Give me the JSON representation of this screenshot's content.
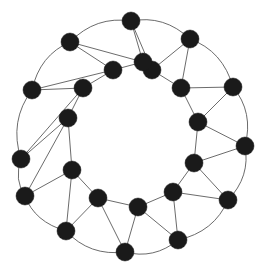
{
  "figure": {
    "type": "node-link-diagram",
    "background_color": "#ffffff",
    "node_color": "#1a1a1a",
    "edge_color": "#5a5a5a",
    "node_radius": 9,
    "edge_width": 0.9,
    "node_count": 24,
    "edge_count": 60,
    "width": 266,
    "height": 275
  },
  "graph_data": {
    "type": "graph",
    "layout": "two-concentric-rings",
    "outer_ring": {
      "count": 12,
      "center": [
        133,
        146
      ],
      "radius": 113
    },
    "inner_ring": {
      "count": 12,
      "center": [
        133,
        140
      ],
      "radius": 72
    },
    "nodes": [
      {
        "id": "o0",
        "ring": "outer",
        "index": 0,
        "x": 131,
        "y": 21
      },
      {
        "id": "o1",
        "ring": "outer",
        "index": 1,
        "x": 190,
        "y": 39
      },
      {
        "id": "o2",
        "ring": "outer",
        "index": 2,
        "x": 233,
        "y": 87
      },
      {
        "id": "o3",
        "ring": "outer",
        "index": 3,
        "x": 245,
        "y": 146
      },
      {
        "id": "o4",
        "ring": "outer",
        "index": 4,
        "x": 228,
        "y": 200
      },
      {
        "id": "o5",
        "ring": "outer",
        "index": 5,
        "x": 178,
        "y": 240
      },
      {
        "id": "o6",
        "ring": "outer",
        "index": 6,
        "x": 125,
        "y": 252
      },
      {
        "id": "o7",
        "ring": "outer",
        "index": 7,
        "x": 66,
        "y": 231
      },
      {
        "id": "o8",
        "ring": "outer",
        "index": 8,
        "x": 25,
        "y": 196
      },
      {
        "id": "o9",
        "ring": "outer",
        "index": 9,
        "x": 21,
        "y": 159
      },
      {
        "id": "o10",
        "ring": "outer",
        "index": 10,
        "x": 32,
        "y": 90
      },
      {
        "id": "o11",
        "ring": "outer",
        "index": 11,
        "x": 70,
        "y": 42
      },
      {
        "id": "i0",
        "ring": "inner",
        "index": 0,
        "x": 152,
        "y": 70
      },
      {
        "id": "i1",
        "ring": "inner",
        "index": 1,
        "x": 181,
        "y": 88
      },
      {
        "id": "i2",
        "ring": "inner",
        "index": 2,
        "x": 198,
        "y": 122
      },
      {
        "id": "i3",
        "ring": "inner",
        "index": 3,
        "x": 194,
        "y": 163
      },
      {
        "id": "i4",
        "ring": "inner",
        "index": 4,
        "x": 173,
        "y": 192
      },
      {
        "id": "i5",
        "ring": "inner",
        "index": 5,
        "x": 138,
        "y": 207
      },
      {
        "id": "i6",
        "ring": "inner",
        "index": 6,
        "x": 98,
        "y": 198
      },
      {
        "id": "i7",
        "ring": "inner",
        "index": 7,
        "x": 72,
        "y": 170
      },
      {
        "id": "i8",
        "ring": "inner",
        "index": 8,
        "x": 68,
        "y": 118
      },
      {
        "id": "i9",
        "ring": "inner",
        "index": 9,
        "x": 83,
        "y": 88
      },
      {
        "id": "i10",
        "ring": "inner",
        "index": 10,
        "x": 113,
        "y": 70
      },
      {
        "id": "i11",
        "ring": "inner",
        "index": 11,
        "x": 143,
        "y": 62
      }
    ],
    "outer_edges": [
      [
        "o0",
        "o1"
      ],
      [
        "o1",
        "o2"
      ],
      [
        "o2",
        "o3"
      ],
      [
        "o3",
        "o4"
      ],
      [
        "o4",
        "o5"
      ],
      [
        "o5",
        "o6"
      ],
      [
        "o6",
        "o7"
      ],
      [
        "o7",
        "o8"
      ],
      [
        "o8",
        "o9"
      ],
      [
        "o9",
        "o10"
      ],
      [
        "o10",
        "o11"
      ],
      [
        "o11",
        "o0"
      ]
    ],
    "inner_edges": [
      [
        "i0",
        "i1"
      ],
      [
        "i1",
        "i2"
      ],
      [
        "i2",
        "i3"
      ],
      [
        "i3",
        "i4"
      ],
      [
        "i4",
        "i5"
      ],
      [
        "i5",
        "i6"
      ],
      [
        "i6",
        "i7"
      ],
      [
        "i7",
        "i8"
      ],
      [
        "i8",
        "i9"
      ],
      [
        "i9",
        "i10"
      ],
      [
        "i10",
        "i11"
      ],
      [
        "i11",
        "i0"
      ]
    ],
    "spoke_edges": [
      [
        "o0",
        "i11"
      ],
      [
        "o0",
        "i0"
      ],
      [
        "o1",
        "i0"
      ],
      [
        "o1",
        "i1"
      ],
      [
        "o2",
        "i1"
      ],
      [
        "o2",
        "i2"
      ],
      [
        "o3",
        "i2"
      ],
      [
        "o3",
        "i3"
      ],
      [
        "o4",
        "i3"
      ],
      [
        "o4",
        "i4"
      ],
      [
        "o5",
        "i4"
      ],
      [
        "o5",
        "i5"
      ],
      [
        "o6",
        "i5"
      ],
      [
        "o6",
        "i6"
      ],
      [
        "o7",
        "i6"
      ],
      [
        "o7",
        "i7"
      ],
      [
        "o8",
        "i7"
      ],
      [
        "o8",
        "i8"
      ],
      [
        "o9",
        "i8"
      ],
      [
        "o9",
        "i9"
      ],
      [
        "o10",
        "i9"
      ],
      [
        "o10",
        "i10"
      ],
      [
        "o11",
        "i10"
      ],
      [
        "o11",
        "i11"
      ]
    ],
    "chord_edges": [
      [
        "i11",
        "i10"
      ],
      [
        "i1",
        "i0"
      ],
      [
        "i3",
        "i2"
      ],
      [
        "i5",
        "i4"
      ],
      [
        "i7",
        "i6"
      ],
      [
        "i9",
        "i8"
      ]
    ],
    "outer_arc_edges": [
      [
        "o0",
        "o1"
      ],
      [
        "o1",
        "o2"
      ],
      [
        "o2",
        "o3"
      ],
      [
        "o3",
        "o4"
      ],
      [
        "o4",
        "o5"
      ],
      [
        "o5",
        "o6"
      ],
      [
        "o6",
        "o7"
      ],
      [
        "o7",
        "o8"
      ],
      [
        "o8",
        "o9"
      ],
      [
        "o9",
        "o10"
      ],
      [
        "o10",
        "o11"
      ],
      [
        "o11",
        "o0"
      ]
    ],
    "arc_curvature": 0.13
  }
}
